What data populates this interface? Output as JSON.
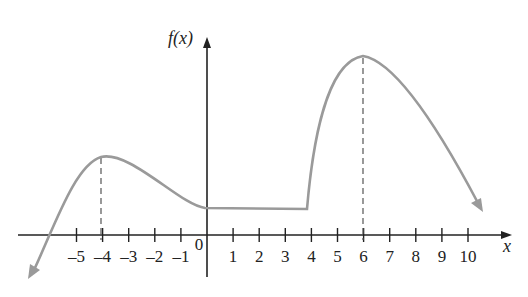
{
  "chart_data": {
    "type": "line",
    "title": "",
    "xlabel": "x",
    "ylabel": "f(x)",
    "x_ticks": [
      "-5",
      "-4",
      "-3",
      "-2",
      "-1",
      "0",
      "1",
      "2",
      "3",
      "4",
      "5",
      "6",
      "7",
      "8",
      "9",
      "10"
    ],
    "xlim": [
      -7,
      10.8
    ],
    "grid": false,
    "legend": null,
    "annotations": [
      {
        "type": "dashed-vertical",
        "x": -4,
        "note": "local maximum"
      },
      {
        "type": "dashed-vertical",
        "x": 6,
        "note": "absolute maximum"
      }
    ],
    "series": [
      {
        "name": "f(x)",
        "color": "#9a9a9a",
        "points": [
          [
            -6.7,
            -1.7
          ],
          [
            -5.5,
            0.5
          ],
          [
            -4,
            3.0
          ],
          [
            -2,
            2.1
          ],
          [
            0,
            1.0
          ],
          [
            0.5,
            0.9
          ],
          [
            4,
            0.9
          ],
          [
            4.3,
            3.0
          ],
          [
            5,
            5.6
          ],
          [
            6,
            6.5
          ],
          [
            7.5,
            5.3
          ],
          [
            9,
            3.4
          ],
          [
            10.6,
            1.0
          ]
        ],
        "notes": "decreasing to -infinity on left (arrow), local max at x=-4, constant on [0,4], sharp rise after x=4, max at x=6, decreasing to right (arrow)"
      }
    ]
  }
}
